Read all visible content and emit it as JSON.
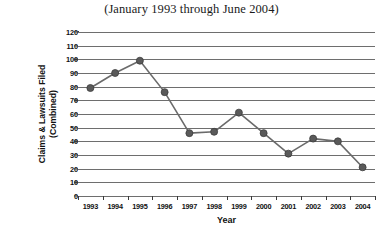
{
  "chart_data": {
    "type": "line",
    "title": "(January 1993 through June 2004)",
    "xlabel": "Year",
    "ylabel": "Claims & Lawsuits Filed (Combined)",
    "ylabel_lines": [
      "Claims & Lawsuits Filed",
      "(Combined)"
    ],
    "categories": [
      "1993",
      "1994",
      "1995",
      "1996",
      "1997",
      "1998",
      "1999",
      "2000",
      "2001",
      "2002",
      "2003",
      "2004"
    ],
    "values": [
      79,
      90,
      99,
      76,
      46,
      47,
      61,
      46,
      31,
      42,
      40,
      21
    ],
    "series": [
      {
        "name": "Claims & Lawsuits Filed (Combined)",
        "values": [
          79,
          90,
          99,
          76,
          46,
          47,
          61,
          46,
          31,
          42,
          40,
          21
        ]
      }
    ],
    "ylim": [
      0,
      120
    ],
    "ytick_step": 10,
    "yticks": [
      0,
      10,
      20,
      30,
      40,
      50,
      60,
      70,
      80,
      90,
      100,
      110,
      120
    ],
    "ytick_labels": [
      "0",
      "10",
      "20",
      "30",
      "40",
      "50",
      "60",
      "70",
      "80",
      "90",
      "100",
      "110",
      "120"
    ],
    "grid": true,
    "grid_axis": "y",
    "legend": false,
    "legend_position": "none",
    "marker": "circle",
    "colors": {
      "line": "#6b6b6b",
      "marker": "#5a5a5a",
      "marker_edge": "#3c3c3c",
      "grid": "#6e6e6e",
      "axis": "#3a3a3a",
      "text": "#111111",
      "background": "#ffffff"
    }
  }
}
